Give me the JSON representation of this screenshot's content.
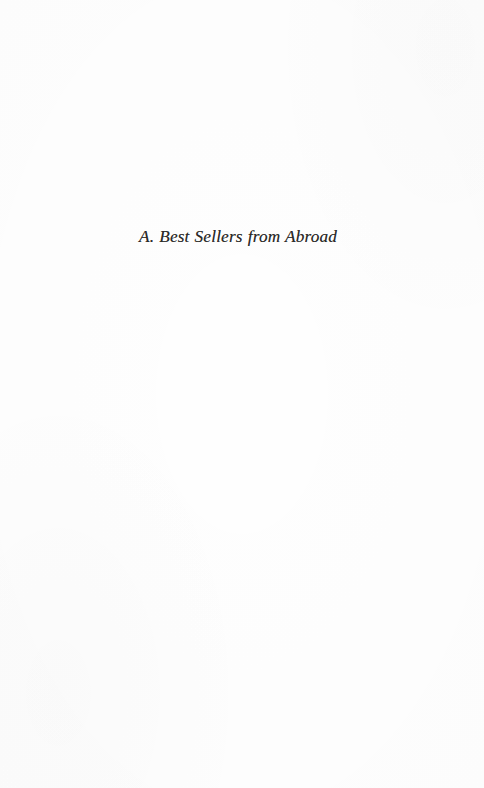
{
  "page": {
    "width": 484,
    "height": 788,
    "background_color": "#fefefe",
    "ink_color": "#2b2a28",
    "kind": "scanned-book-divider-page"
  },
  "content": {
    "section_heading": "A. Best Sellers from Abroad"
  }
}
